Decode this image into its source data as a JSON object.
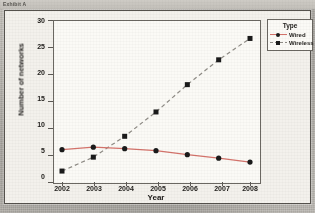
{
  "page": {
    "caption": "Exhibit A"
  },
  "chart_data": {
    "type": "line",
    "title": "",
    "xlabel": "Year",
    "ylabel": "Number of networks",
    "categories": [
      "2002",
      "2003",
      "2004",
      "2005",
      "2006",
      "2007",
      "2008"
    ],
    "x": [
      2002,
      2003,
      2004,
      2005,
      2006,
      2007,
      2008
    ],
    "series": [
      {
        "name": "Wired",
        "values": [
          6.1,
          6.6,
          6.3,
          5.9,
          5.1,
          4.4,
          3.6
        ],
        "color": "#d4736b",
        "marker": "circle",
        "linestyle": "solid"
      },
      {
        "name": "Wireless",
        "values": [
          1.8,
          4.6,
          8.8,
          13.7,
          19.2,
          24.2,
          28.5
        ],
        "color": "#8f8c86",
        "marker": "square",
        "linestyle": "dashed"
      }
    ],
    "ylim": [
      0,
      30
    ],
    "yticks": [
      0,
      5,
      10,
      15,
      20,
      25,
      30
    ],
    "xlim": [
      2002,
      2008
    ],
    "grid": false,
    "legend_position": "top-right"
  },
  "legend": {
    "title": "Type",
    "entries": [
      "Wired",
      "Wireless"
    ]
  },
  "colors": {
    "wired": "#d4736b",
    "wireless": "#8f8c86",
    "marker": "#1a1a1a",
    "axis": "#5d5a55",
    "plot_bg": "#fbfaf6",
    "panel_bg": "#f3f1ec",
    "page_bg": "#b9b6b0"
  }
}
